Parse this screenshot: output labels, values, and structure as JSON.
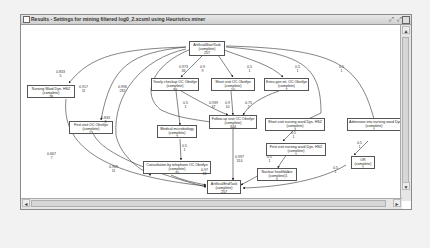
{
  "window": {
    "title": "Results - Settings for mining filtered log0_2.xcsml using Heuristics miner",
    "buttons": {
      "restore": "⤢",
      "maximize": "⤢",
      "close": "⊠"
    }
  },
  "graph": {
    "nodes": [
      {
        "id": "start",
        "label": "ArtificialStartTask",
        "status": "(complete)",
        "count": "257"
      },
      {
        "id": "nursing_ward",
        "label": "Nursing Ward Dyn. HSZ",
        "status": "(complete)",
        "count": "78"
      },
      {
        "id": "yearly_checkup",
        "label": "Yearly checkup OC Obstfyn",
        "status": "(complete)",
        "count": "39"
      },
      {
        "id": "short_visit_oc",
        "label": "Short visit OC Obstfyn",
        "status": "(complete)",
        "count": "10"
      },
      {
        "id": "extra_gen",
        "label": "Extra gen int. OC Obstfyn",
        "status": "(complete)",
        "count": "2"
      },
      {
        "id": "short_visit_nursing",
        "label": "Short visit nursing ward Dyn. HSZ",
        "status": "(complete)",
        "count": "4"
      },
      {
        "id": "admission",
        "label": "Admission into nursing ward Dyn. HSZ",
        "status": "(complete)",
        "count": "1"
      },
      {
        "id": "medical_micro",
        "label": "Medical microbiology",
        "status": "(complete)",
        "count": "2"
      },
      {
        "id": "followup",
        "label": "Follow-up visit OC Obstfyn",
        "status": "(complete)",
        "count": "344"
      },
      {
        "id": "first_visit_oc",
        "label": "First visit OC Obstfyn",
        "status": "(complete)",
        "count": "13"
      },
      {
        "id": "first_visit_nursing",
        "label": "First visit nursing ward Dyn. HSZ",
        "status": "(complete)",
        "count": "1"
      },
      {
        "id": "or",
        "label": "OR",
        "status": "(complete)",
        "count": "1"
      },
      {
        "id": "consultation",
        "label": "Consultation by telephone OC Obstfyn",
        "status": "(complete)",
        "count": "40"
      },
      {
        "id": "nuclear",
        "label": "Nuclear health care",
        "status": "(complete)",
        "count": "5"
      },
      {
        "id": "end",
        "label": "ArtificialEndTask",
        "status": "(complete)",
        "count": "257"
      }
    ],
    "edges": [
      {
        "from": "start",
        "to": "nursing_ward",
        "dep": "0.833",
        "freq": "5"
      },
      {
        "from": "start",
        "to": "first_visit_oc",
        "dep": "0.917",
        "freq": "11"
      },
      {
        "from": "start",
        "to": "consultation",
        "dep": "0.833",
        "freq": "8"
      },
      {
        "from": "start",
        "to": "followup",
        "dep": "0.996",
        "freq": "282"
      },
      {
        "from": "start",
        "to": "yearly_checkup",
        "dep": "0.973",
        "freq": "36"
      },
      {
        "from": "start",
        "to": "short_visit_oc",
        "dep": "0.9",
        "freq": "9"
      },
      {
        "from": "start",
        "to": "extra_gen",
        "dep": "0.5",
        "freq": "1"
      },
      {
        "from": "start",
        "to": "short_visit_nursing",
        "dep": "0.5",
        "freq": "1"
      },
      {
        "from": "start",
        "to": "admission",
        "dep": "0.5",
        "freq": "1"
      },
      {
        "from": "yearly_checkup",
        "to": "medical_micro",
        "dep": "0.5",
        "freq": "1"
      },
      {
        "from": "yearly_checkup",
        "to": "followup",
        "dep": "0.939",
        "freq": "37"
      },
      {
        "from": "short_visit_oc",
        "to": "followup",
        "dep": "0.9",
        "freq": "10"
      },
      {
        "from": "extra_gen",
        "to": "followup",
        "dep": "0.75",
        "freq": "2"
      },
      {
        "from": "short_visit_nursing",
        "to": "first_visit_nursing",
        "dep": "0.5",
        "freq": "1"
      },
      {
        "from": "admission",
        "to": "or",
        "dep": "0.5",
        "freq": "1"
      },
      {
        "from": "medical_micro",
        "to": "consultation",
        "dep": "0.5",
        "freq": "1"
      },
      {
        "from": "nursing_ward",
        "to": "end",
        "dep": "0.667",
        "freq": "7"
      },
      {
        "from": "first_visit_oc",
        "to": "end",
        "dep": "0.909",
        "freq": "11"
      },
      {
        "from": "consultation",
        "to": "end",
        "dep": "0.97",
        "freq": "18"
      },
      {
        "from": "followup",
        "to": "end",
        "dep": "0.997",
        "freq": "314"
      },
      {
        "from": "first_visit_nursing",
        "to": "nuclear",
        "dep": "0.5",
        "freq": "1"
      },
      {
        "from": "nuclear",
        "to": "end",
        "dep": "0.5",
        "freq": "1"
      },
      {
        "from": "or",
        "to": "end",
        "dep": "0.5",
        "freq": "1"
      }
    ]
  },
  "scrollbars": {
    "up": "▲",
    "down": "▼",
    "left": "◄",
    "right": "►"
  }
}
